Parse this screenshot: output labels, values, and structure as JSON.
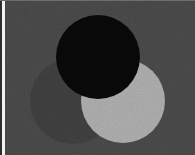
{
  "image": {
    "title": "Three overlapping circles on gray background",
    "width": 195,
    "height": 155,
    "background_color": "#434343",
    "medium": "raster-photo-grain"
  },
  "edges": {
    "left_dark_rule_color": "#2e2e2e",
    "left_light_strip_color": "#f2f2f2",
    "top_light_rule_color": "#6d6d6d"
  },
  "shapes": [
    {
      "id": "circle-dark-left",
      "name": "dark gray circle",
      "cx": 73,
      "cy": 101,
      "r": 43,
      "fill": "#3a3a3a",
      "z": 1
    },
    {
      "id": "circle-light-right",
      "name": "light gray circle",
      "cx": 123,
      "cy": 101,
      "r": 42,
      "fill": "#a2a2a2",
      "z": 2
    },
    {
      "id": "circle-black-top",
      "name": "black circle",
      "cx": 98,
      "cy": 57,
      "r": 42,
      "fill": "#080808",
      "z": 3
    }
  ]
}
